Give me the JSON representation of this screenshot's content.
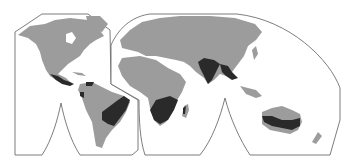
{
  "map": {
    "type": "interrupted world projection",
    "colors": {
      "background": "#ffffff",
      "outline": "#6e6e6e",
      "land": "#9c9c9c",
      "highlighted_region": "#2a2a2a"
    },
    "highlighted_regions": [
      "Central America (southern Mexico)",
      "Northern South America (Venezuela/Colombia coast)",
      "Eastern Brazil",
      "Southern Africa",
      "Madagascar (western part)",
      "India and Pakistan",
      "Myanmar / Indochina",
      "Northern and eastern Australia"
    ]
  }
}
